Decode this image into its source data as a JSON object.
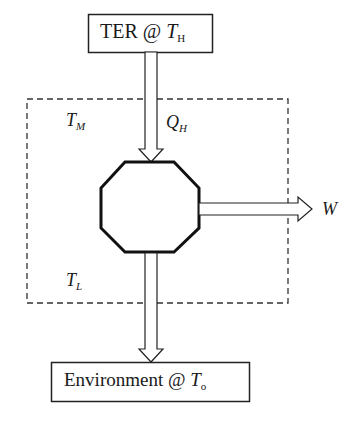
{
  "diagram": {
    "source_box": {
      "text": "TER @ ",
      "var": "T",
      "sub": "H"
    },
    "sink_box": {
      "text": "Environment @ ",
      "var": "T",
      "sub": "o"
    },
    "region_labels": [
      {
        "var": "T",
        "sub": "M"
      },
      {
        "var": "T",
        "sub": "L"
      }
    ],
    "heat_in": {
      "var": "Q",
      "sub": "H"
    },
    "work_out": {
      "var": "W"
    },
    "engine_shape": "octagon",
    "boundary_style": "dashed"
  }
}
